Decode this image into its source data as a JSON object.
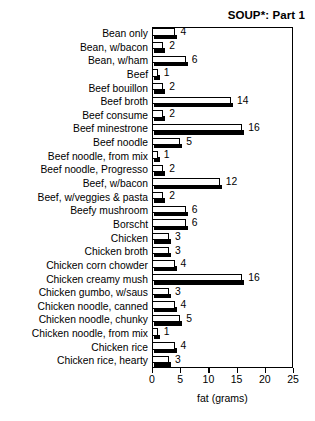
{
  "chart_data": {
    "type": "bar",
    "orientation": "horizontal",
    "title": "SOUP*: Part 1",
    "xlabel": "fat (grams)",
    "ylabel": "",
    "xlim": [
      0,
      25
    ],
    "xticks": [
      0,
      5,
      10,
      15,
      20,
      25
    ],
    "xtick_labels": [
      "0",
      "5",
      "10",
      "15",
      "20",
      "25"
    ],
    "grid": false,
    "legend": null,
    "categories": [
      "Bean only",
      "Bean, w/bacon",
      "Bean, w/ham",
      "Beef",
      "Beef bouillon",
      "Beef broth",
      "Beef consume",
      "Beef minestrone",
      "Beef noodle",
      "Beef noodle, from mix",
      "Beef noodle, Progresso",
      "Beef, w/bacon",
      "Beef, w/veggies & pasta",
      "Beefy mushroom",
      "Borscht",
      "Chicken",
      "Chicken broth",
      "Chicken corn chowder",
      "Chicken creamy mush",
      "Chicken gumbo, w/saus",
      "Chicken noodle, canned",
      "Chicken noodle, chunky",
      "Chicken noodle, from mix",
      "Chicken rice",
      "Chicken rice, hearty"
    ],
    "values": [
      4,
      2,
      6,
      1,
      2,
      14,
      2,
      16,
      5,
      1,
      2,
      12,
      2,
      6,
      6,
      3,
      3,
      4,
      16,
      3,
      4,
      5,
      1,
      4,
      3
    ],
    "value_labels": [
      "4",
      "2",
      "6",
      "1",
      "2",
      "14",
      "2",
      "16",
      "5",
      "1",
      "2",
      "12",
      "2",
      "6",
      "6",
      "3",
      "3",
      "4",
      "16",
      "3",
      "4",
      "5",
      "1",
      "4",
      "3"
    ]
  },
  "colors": {
    "bar_face": "#ffffff",
    "bar_outline": "#000000",
    "bar_shadow": "#000000",
    "axis": "#000000",
    "text": "#000000",
    "background": "#ffffff"
  }
}
